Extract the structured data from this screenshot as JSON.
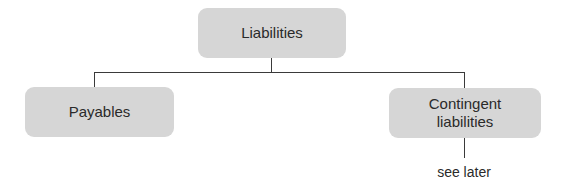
{
  "diagram": {
    "type": "hierarchy",
    "root": {
      "label": "Liabilities"
    },
    "children": [
      {
        "label": "Payables"
      },
      {
        "label": "Contingent liabilities",
        "label_lines": [
          "Contingent",
          "liabilities"
        ],
        "note": "see later"
      }
    ],
    "colors": {
      "node_fill": "#d6d6d6",
      "connector": "#3a3a3a",
      "text": "#2a2a2a"
    }
  }
}
